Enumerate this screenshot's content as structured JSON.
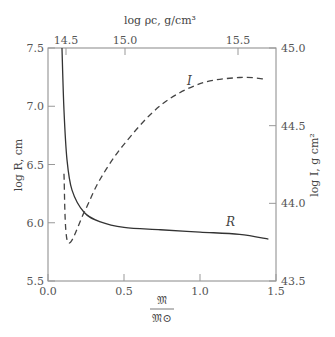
{
  "chart_data": {
    "type": "line",
    "title": "",
    "xlabel": "𝔐 / 𝔐⊙",
    "xlabel_num": "𝔐",
    "xlabel_den": "𝔐⊙",
    "ylabel": "log R, cm",
    "ylabel_right": "log I, g cm²",
    "xlabel_top": "log ρc, g/cm³",
    "xlim": [
      0.0,
      1.5
    ],
    "ylim": [
      5.5,
      7.5
    ],
    "ylim_right": [
      43.5,
      45.0
    ],
    "x_ticks": [
      "0.0",
      "0.5",
      "1.0",
      "1.5"
    ],
    "y_ticks": [
      "5.5",
      "6.0",
      "6.5",
      "7.0",
      "7.5"
    ],
    "y_ticks_right": [
      "43.5",
      "44.0",
      "44.5",
      "45.0"
    ],
    "x_ticks_top": [
      "14.5",
      "15.0",
      "15.5"
    ],
    "grid": false,
    "legend": "none (curves labeled inline)",
    "series": [
      {
        "name": "R",
        "axis": "left",
        "style": "solid",
        "x": [
          0.092,
          0.105,
          0.125,
          0.158,
          0.237,
          0.34,
          0.5,
          0.74,
          1.0,
          1.26,
          1.45
        ],
        "values": [
          7.5,
          6.97,
          6.54,
          6.28,
          6.09,
          6.01,
          5.96,
          5.94,
          5.92,
          5.9,
          5.86
        ]
      },
      {
        "name": "I",
        "axis": "right",
        "style": "dashed",
        "x": [
          0.105,
          0.13,
          0.237,
          0.34,
          0.5,
          0.74,
          1.0,
          1.26,
          1.43
        ],
        "values": [
          44.19,
          43.75,
          43.94,
          44.15,
          44.38,
          44.63,
          44.77,
          44.81,
          44.8
        ]
      }
    ],
    "annotations": [
      {
        "text": "R",
        "near_series": "R"
      },
      {
        "text": "I",
        "near_series": "I"
      }
    ]
  }
}
